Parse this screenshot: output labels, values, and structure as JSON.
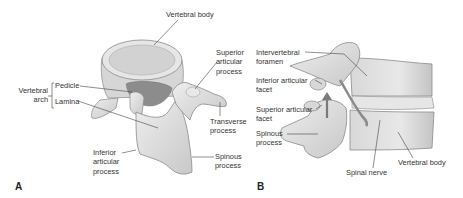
{
  "figure": {
    "panel_a": {
      "letter": "A",
      "labels": {
        "vertebral_body": "Vertebral body",
        "superior_articular_process": "Superior\narticular\nprocess",
        "vertebral_arch": "Vertebral\narch",
        "pedicle": "Pedicle",
        "lamina": "Lamina",
        "transverse_process": "Transverse\nprocess",
        "inferior_articular_process": "Inferior\narticular\nprocess",
        "spinous_process": "Spinous\nprocess"
      }
    },
    "panel_b": {
      "letter": "B",
      "labels": {
        "intervertebral_foramen": "Intervertebral\nforamen",
        "inferior_articular_facet": "Inferior articular\nfacet",
        "superior_articular_facet": "Superior articular\nfacet",
        "spinous_process": "Spinous\nprocess",
        "spinal_nerve": "Spinal nerve",
        "vertebral_body": "Vertebral body"
      }
    }
  },
  "colors": {
    "bone_light": "#e4e4e4",
    "bone_mid": "#cfcfcf",
    "bone_dark": "#9a9a9a",
    "outline": "#8a8a8a",
    "leader": "#444444",
    "text": "#333333"
  }
}
